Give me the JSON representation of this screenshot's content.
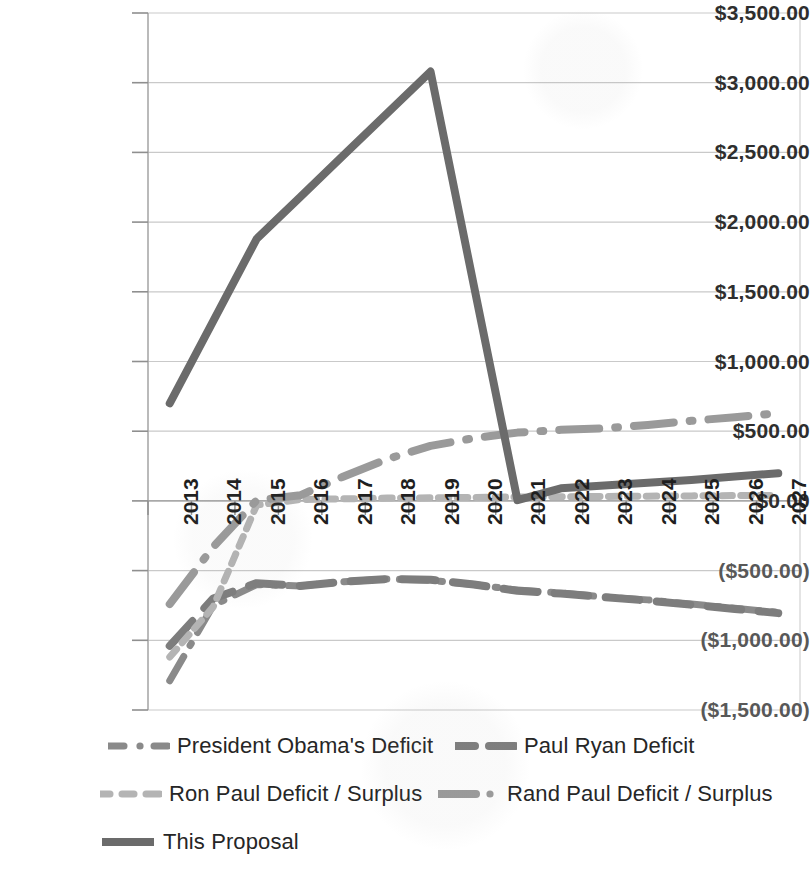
{
  "chart_data": {
    "type": "line",
    "title": "",
    "subtitle": "",
    "xlabel": "",
    "ylabel": "",
    "grid": true,
    "legend_position": "bottom",
    "axis": {
      "xlim_categories": [
        "2013",
        "2027"
      ],
      "ylim": [
        -1500,
        3500
      ],
      "ytick_step": 500
    },
    "categories": [
      "2013",
      "2014",
      "2015",
      "2016",
      "2017",
      "2018",
      "2019",
      "2020",
      "2021",
      "2022",
      "2023",
      "2024",
      "2025",
      "2026",
      "2027"
    ],
    "ytick_labels": [
      "$3,500.00",
      "$3,000.00",
      "$2,500.00",
      "$2,000.00",
      "$1,500.00",
      "$1,000.00",
      "$500.00",
      "$0.00",
      "($500.00)",
      "($1,000.00)",
      "($1,500.00)"
    ],
    "ytick_values": [
      3500,
      3000,
      2500,
      2000,
      1500,
      1000,
      500,
      0,
      -500,
      -1000,
      -1500
    ],
    "series": [
      {
        "name": "President Obama's Deficit",
        "color": "#8a8a8a",
        "dash": "dash-dot",
        "width": 7,
        "values": [
          -1290,
          -750,
          -600,
          -610,
          -580,
          -560,
          -570,
          -600,
          -640,
          -660,
          -690,
          -710,
          -740,
          -770,
          -800
        ]
      },
      {
        "name": "Paul Ryan Deficit",
        "color": "#7d7d7d",
        "dash": "dash",
        "width": 8,
        "values": [
          -1040,
          -700,
          -590,
          -610,
          -580,
          -560,
          -565,
          -600,
          -645,
          -665,
          -690,
          -715,
          -745,
          -775,
          -805
        ]
      },
      {
        "name": "Ron Paul Deficit / Surplus",
        "color": "#b4b4b4",
        "dash": "short-dash",
        "width": 7,
        "values": [
          -1120,
          -760,
          -30,
          10,
          15,
          20,
          22,
          25,
          28,
          30,
          32,
          34,
          36,
          38,
          40
        ]
      },
      {
        "name": "Rand Paul Deficit / Surplus",
        "color": "#9a9a9a",
        "dash": "long-dash-dot",
        "width": 8,
        "values": [
          -740,
          -330,
          5,
          40,
          175,
          300,
          395,
          450,
          490,
          510,
          520,
          545,
          575,
          600,
          630
        ]
      },
      {
        "name": "This Proposal",
        "color": "#6b6b6b",
        "dash": "solid",
        "width": 8,
        "values": [
          700,
          1290,
          1880,
          2180,
          2480,
          2780,
          3080,
          1540,
          5,
          90,
          110,
          130,
          150,
          175,
          198
        ]
      }
    ],
    "legend": [
      {
        "label": "President Obama's Deficit",
        "marker": "dash-dot",
        "color": "#8a8a8a"
      },
      {
        "label": "Paul Ryan Deficit",
        "marker": "dash",
        "color": "#7d7d7d"
      },
      {
        "label": "Ron Paul Deficit / Surplus",
        "marker": "short-dash",
        "color": "#b4b4b4"
      },
      {
        "label": "Rand Paul Deficit / Surplus",
        "marker": "long-dash-dot",
        "color": "#9a9a9a"
      },
      {
        "label": "This Proposal",
        "marker": "solid",
        "color": "#6b6b6b"
      }
    ]
  }
}
